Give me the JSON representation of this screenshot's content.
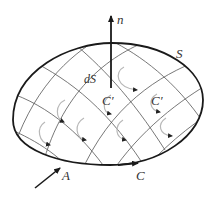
{
  "labels": {
    "normal": "n",
    "surface": "S",
    "surface_element": "dS",
    "cell_contour_1": "C′",
    "cell_contour_2": "C′",
    "point": "A",
    "boundary": "C"
  },
  "colors": {
    "outline": "#1a1a1a",
    "grid": "#555555",
    "cell_loop": "#b8b8b8",
    "cell_arrow": "#222222",
    "text": "#333333",
    "background": "#ffffff"
  }
}
